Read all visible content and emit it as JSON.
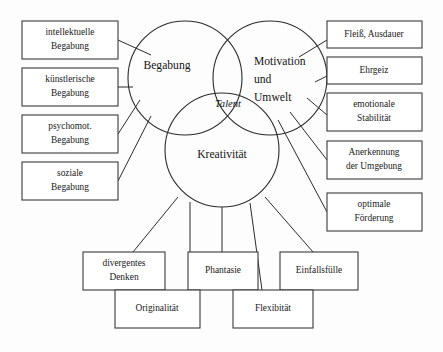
{
  "diagram": {
    "type": "venn-diagram",
    "background_color": "#fdfdfd",
    "stroke_color": "#2b2b2b",
    "box_fill_color": "#ffffff",
    "center_label": "Talent",
    "circles": [
      {
        "id": "begabung",
        "label": "Begabung",
        "cx": 185,
        "cy": 78,
        "r": 57
      },
      {
        "id": "motivation",
        "label_line_1": "Motivation",
        "label_line_2": "und",
        "label_line_3": "Umwelt",
        "cx": 270,
        "cy": 78,
        "r": 57
      },
      {
        "id": "kreativitaet",
        "label": "Kreativität",
        "cx": 222,
        "cy": 150,
        "r": 57
      }
    ],
    "left_boxes": [
      {
        "id": "intellektuelle",
        "line_1": "intellektuelle",
        "line_2": "Begabung"
      },
      {
        "id": "kuenstlerische",
        "line_1": "künstlerische",
        "line_2": "Begabung"
      },
      {
        "id": "psychomot",
        "line_1": "psychomot.",
        "line_2": "Begabung"
      },
      {
        "id": "soziale",
        "line_1": "soziale",
        "line_2": "Begabung"
      }
    ],
    "right_boxes": [
      {
        "id": "fleiss",
        "line_1": "Fleiß, Ausdauer",
        "line_2": ""
      },
      {
        "id": "ehrgeiz",
        "line_1": "Ehrgeiz",
        "line_2": ""
      },
      {
        "id": "emotionale",
        "line_1": "emotionale",
        "line_2": "Stabilität"
      },
      {
        "id": "anerkennung",
        "line_1": "Anerkennung",
        "line_2": "der Umgebung"
      },
      {
        "id": "optimale",
        "line_1": "optimale",
        "line_2": "Förderung"
      }
    ],
    "bottom_boxes": [
      {
        "id": "divergentes",
        "line_1": "divergentes",
        "line_2": "Denken"
      },
      {
        "id": "originalitaet",
        "line_1": "Originalität",
        "line_2": ""
      },
      {
        "id": "phantasie",
        "line_1": "Phantasie",
        "line_2": ""
      },
      {
        "id": "flexibitaet",
        "line_1": "Flexibität",
        "line_2": ""
      },
      {
        "id": "einfallsfuelle",
        "line_1": "Einfallsfülle",
        "line_2": ""
      }
    ]
  }
}
